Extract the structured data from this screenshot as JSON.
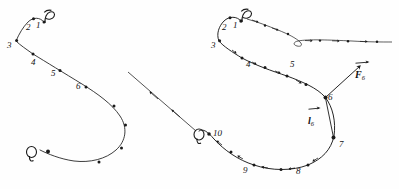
{
  "figure": {
    "ink_color": "#1a1a1a",
    "background_color": "#fefefe"
  },
  "left_figure": {
    "name": "left-curve",
    "start_label": "P",
    "end_label": "Q",
    "point_labels": [
      "1",
      "2",
      "3",
      "4",
      "5",
      "6"
    ],
    "labels": [
      {
        "text": "P",
        "x": 46,
        "y": 12,
        "kind": "point"
      },
      {
        "text": "1",
        "x": 38,
        "y": 25,
        "kind": "num"
      },
      {
        "text": "2",
        "x": 29,
        "y": 27,
        "kind": "num"
      },
      {
        "text": "3",
        "x": 9,
        "y": 45,
        "kind": "num"
      },
      {
        "text": "4",
        "x": 33,
        "y": 62,
        "kind": "num"
      },
      {
        "text": "5",
        "x": 53,
        "y": 72,
        "kind": "num"
      },
      {
        "text": "6",
        "x": 78,
        "y": 85,
        "kind": "num"
      },
      {
        "text": "Q",
        "x": 23,
        "y": 150,
        "kind": "point"
      }
    ],
    "dot_count": 11
  },
  "right_figure": {
    "name": "right-curve",
    "start_label": "P",
    "end_label": "Q",
    "point_labels": [
      "1",
      "2",
      "3",
      "4",
      "5",
      "6",
      "7",
      "8",
      "9",
      "10"
    ],
    "labels": [
      {
        "text": "P",
        "x": 243,
        "y": 11,
        "kind": "point"
      },
      {
        "text": "1",
        "x": 235,
        "y": 25,
        "kind": "num"
      },
      {
        "text": "2",
        "x": 224,
        "y": 27,
        "kind": "num"
      },
      {
        "text": "3",
        "x": 215,
        "y": 45,
        "kind": "num"
      },
      {
        "text": "4",
        "x": 248,
        "y": 63,
        "kind": "num"
      },
      {
        "text": "5",
        "x": 292,
        "y": 63,
        "kind": "num"
      },
      {
        "text": "6",
        "x": 328,
        "y": 96,
        "kind": "num"
      },
      {
        "text": "7",
        "x": 338,
        "y": 143,
        "kind": "num"
      },
      {
        "text": "8",
        "x": 297,
        "y": 170,
        "kind": "num"
      },
      {
        "text": "9",
        "x": 244,
        "y": 169,
        "kind": "num"
      },
      {
        "text": "10",
        "x": 214,
        "y": 133,
        "kind": "num"
      },
      {
        "text": "Q",
        "x": 194,
        "y": 133,
        "kind": "point"
      }
    ],
    "vectors": [
      {
        "name": "force-vector",
        "symbol": "F",
        "subscript": "6",
        "label_x": 355,
        "label_y": 70
      },
      {
        "name": "displacement-vector",
        "symbol": "l",
        "subscript": "6",
        "label_x": 308,
        "label_y": 115
      }
    ],
    "dot_count": 11
  }
}
